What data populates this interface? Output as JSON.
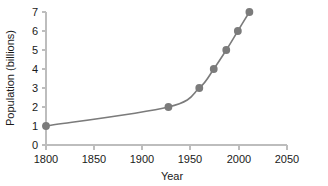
{
  "chart_data": {
    "type": "line",
    "title": "",
    "xlabel": "Year",
    "ylabel": "Population (billions)",
    "x": [
      1800,
      1927,
      1959,
      1974,
      1987,
      1999,
      2011
    ],
    "values": [
      1,
      2,
      3,
      4,
      5,
      6,
      7
    ],
    "series": [
      {
        "name": "World population",
        "x": [
          1800,
          1927,
          1959,
          1974,
          1987,
          1999,
          2011
        ],
        "values": [
          1,
          2,
          3,
          4,
          5,
          6,
          7
        ]
      }
    ],
    "xlim": [
      1800,
      2050
    ],
    "ylim": [
      0,
      7
    ],
    "xticks": [
      1800,
      1850,
      1900,
      1950,
      2000,
      2050
    ],
    "yticks": [
      0,
      1,
      2,
      3,
      4,
      5,
      6,
      7
    ],
    "xtick_labels": [
      "1800",
      "1850",
      "1900",
      "1950",
      "2000",
      "2050"
    ],
    "ytick_labels": [
      "0",
      "1",
      "2",
      "3",
      "4",
      "5",
      "6",
      "7"
    ],
    "grid": false,
    "legend": false,
    "legend_position": "none",
    "marker": "circle",
    "colors": {
      "series": "#7b7b7b",
      "marker": "#7b7b7b",
      "axis": "#bdbdbd",
      "text": "#1a1a1a",
      "background": "#ffffff"
    }
  }
}
